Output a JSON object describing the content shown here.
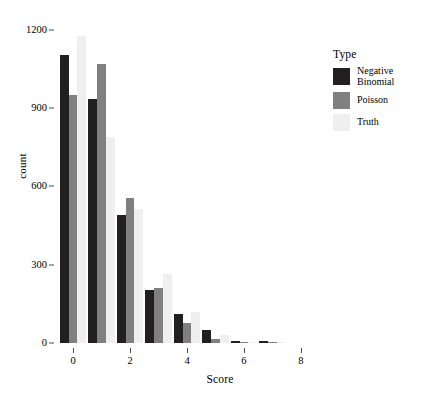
{
  "chart_data": {
    "type": "bar",
    "title": "",
    "subtitle": "",
    "xlabel": "Score",
    "ylabel": "count",
    "categories": [
      0,
      1,
      2,
      3,
      4,
      5,
      6,
      7,
      8
    ],
    "x_tick_labels": [
      "0",
      "2",
      "4",
      "6",
      "8"
    ],
    "x_tick_values": [
      0,
      2,
      4,
      6,
      8
    ],
    "y_tick_labels": [
      "0",
      "300",
      "600",
      "900",
      "1200"
    ],
    "y_tick_values": [
      0,
      300,
      600,
      900,
      1200
    ],
    "ylim": [
      0,
      1245
    ],
    "xlim": [
      -0.6,
      8.6
    ],
    "grid": false,
    "legend_position": "right",
    "legend_title": "Type",
    "series": [
      {
        "name": "Negative Binomial",
        "color": "#231f20",
        "values": [
          1105,
          935,
          490,
          205,
          110,
          50,
          8,
          6,
          0
        ]
      },
      {
        "name": "Poisson",
        "color": "#808080",
        "values": [
          950,
          1070,
          555,
          210,
          75,
          15,
          4,
          5,
          0
        ]
      },
      {
        "name": "Truth",
        "color": "#efefef",
        "values": [
          1175,
          790,
          515,
          265,
          120,
          30,
          5,
          2,
          0
        ]
      }
    ]
  },
  "axes": {
    "tick_color": "#4d4d4d",
    "text_color": "#000000",
    "background": "#ffffff"
  }
}
